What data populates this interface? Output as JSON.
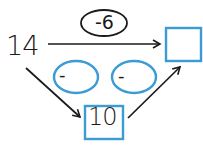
{
  "diagram": {
    "start_value": "14",
    "top_operation": "-6",
    "result_box": "",
    "middle_value": "10",
    "step1_operation": "-",
    "step2_operation": "-",
    "colors": {
      "accent_blue": "#3a9bd5",
      "ink": "#1a1a1a",
      "background": "#ffffff"
    }
  }
}
